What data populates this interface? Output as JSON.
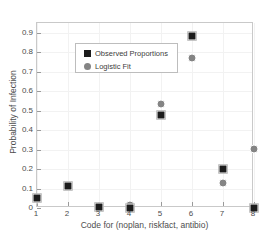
{
  "chart_data": {
    "type": "scatter",
    "title": "",
    "xlabel": "Code for (noplan, riskfact, antibio)",
    "ylabel": "Probability of Infection",
    "xlim": [
      1,
      8
    ],
    "ylim": [
      0,
      0.95
    ],
    "xticks": [
      "1",
      "2",
      "3",
      "4",
      "5",
      "6",
      "7",
      "8"
    ],
    "yticks": [
      "0",
      "0.1",
      "0.2",
      "0.3",
      "0.4",
      "0.5",
      "0.6",
      "0.7",
      "0.8",
      "0.9"
    ],
    "grid": true,
    "legend_position": "upper left",
    "x": [
      1,
      2,
      3,
      4,
      5,
      6,
      7,
      8
    ],
    "series": [
      {
        "name": "Observed Proportions",
        "marker": "square",
        "color": "#1c1c1c",
        "values": [
          0.05,
          0.115,
          0.005,
          0.0,
          0.48,
          0.885,
          0.2,
          0.0
        ]
      },
      {
        "name": "Logistic Fit",
        "marker": "circle",
        "color": "#848484",
        "values": [
          0.045,
          0.115,
          0.01,
          0.015,
          0.535,
          0.77,
          0.13,
          0.305
        ]
      }
    ]
  },
  "legend": {
    "entries": [
      {
        "label": "Observed Proportions",
        "marker": "square"
      },
      {
        "label": "Logistic Fit",
        "marker": "circle"
      }
    ]
  },
  "colors": {
    "observed": "#1c1c1c",
    "fit": "#848484",
    "axis": "#c9c9c9",
    "grid": "#f2f2f2",
    "text": "#4d4d4d",
    "background": "#ffffff"
  }
}
